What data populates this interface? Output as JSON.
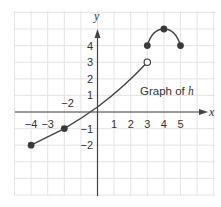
{
  "chart_data": {
    "type": "line",
    "title": "Graph of h",
    "function_name": "h",
    "xlabel": "x",
    "ylabel": "y",
    "xlim": [
      -5,
      7
    ],
    "ylim": [
      -5,
      6
    ],
    "grid": true,
    "x_tick_labels": [
      "-4",
      "-3",
      "1",
      "2",
      "3",
      "4",
      "5"
    ],
    "x_tick_values": [
      -4,
      -3,
      1,
      2,
      3,
      4,
      5
    ],
    "y_tick_labels": [
      "4",
      "3",
      "2",
      "1",
      "-1",
      "-2"
    ],
    "y_tick_values": [
      4,
      3,
      2,
      1,
      -1,
      -2
    ],
    "extra_labels": [
      {
        "text": "-2",
        "x": -1.8,
        "y": 0.55
      }
    ],
    "series": [
      {
        "name": "h piece 1",
        "points": [
          [
            -4,
            -2
          ],
          [
            -2,
            -1
          ],
          [
            0,
            0.3
          ],
          [
            3,
            3
          ]
        ],
        "endpoints": [
          {
            "x": -4,
            "y": -2,
            "style": "closed"
          },
          {
            "x": -2,
            "y": -1,
            "style": "closed"
          },
          {
            "x": 3,
            "y": 3,
            "style": "open"
          }
        ]
      },
      {
        "name": "h piece 2",
        "points": [
          [
            3,
            4
          ],
          [
            4,
            5
          ],
          [
            5,
            4
          ]
        ],
        "endpoints": [
          {
            "x": 3,
            "y": 4,
            "style": "closed"
          },
          {
            "x": 4,
            "y": 5,
            "style": "closed"
          },
          {
            "x": 5,
            "y": 4,
            "style": "closed"
          }
        ]
      }
    ],
    "caption": {
      "text_prefix": "Graph of ",
      "text_var": "h"
    }
  },
  "colors": {
    "grid": "#e4e4e4",
    "axis": "#444444",
    "curve": "#444444",
    "point": "#3a3a3a"
  }
}
